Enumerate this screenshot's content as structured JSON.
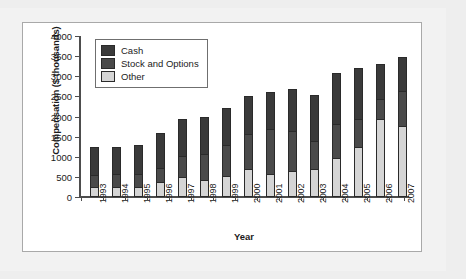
{
  "figure": {
    "panel_name": "stacked-bar-chart-panel"
  },
  "chart_data": {
    "type": "bar",
    "stacked": true,
    "title": "",
    "xlabel": "Year",
    "ylabel": "Compensation ($ thousands)",
    "ylim": [
      0,
      4000
    ],
    "y_ticks": [
      0,
      500,
      1000,
      1500,
      2000,
      2500,
      3000,
      3500,
      4000
    ],
    "y_tick_labels": [
      "0",
      "500",
      "1000",
      "1500",
      "2000",
      "2500",
      "3000",
      "3500",
      "4000"
    ],
    "grid": false,
    "legend_position": "upper-left-inside",
    "categories": [
      "1993",
      "1994",
      "1995",
      "1996",
      "1997",
      "1998",
      "1999",
      "2000",
      "2001",
      "2002",
      "2003",
      "2004",
      "2005",
      "2006",
      "2007"
    ],
    "series": [
      {
        "name": "Other",
        "color": "#d5d5d5",
        "values": [
          250,
          240,
          250,
          375,
          490,
          420,
          520,
          690,
          560,
          640,
          690,
          965,
          1245,
          1945,
          1760
        ]
      },
      {
        "name": "Stock and Options",
        "color": "#4a4a4a",
        "values": [
          300,
          340,
          320,
          350,
          520,
          650,
          780,
          870,
          1125,
          990,
          710,
          860,
          690,
          480,
          870
        ]
      },
      {
        "name": "Cash",
        "color": "#3a3a3a",
        "values": [
          700,
          670,
          730,
          875,
          930,
          910,
          920,
          945,
          915,
          1045,
          1145,
          1265,
          1280,
          875,
          860
        ]
      }
    ],
    "totals": [
      1250,
      1250,
      1300,
      1600,
      1940,
      1980,
      2220,
      2505,
      2600,
      2675,
      2545,
      3090,
      3215,
      3300,
      3490
    ],
    "legend_entries": [
      "Cash",
      "Stock and Options",
      "Other"
    ]
  },
  "colors": {
    "cash": "#3a3a3a",
    "stock_and_options": "#4a4a4a",
    "other": "#d5d5d5",
    "axis": "#4d4d4d",
    "panel_background": "#ffffff",
    "page_background": "#f2f2f2",
    "panel_border": "#a9a9a9"
  }
}
